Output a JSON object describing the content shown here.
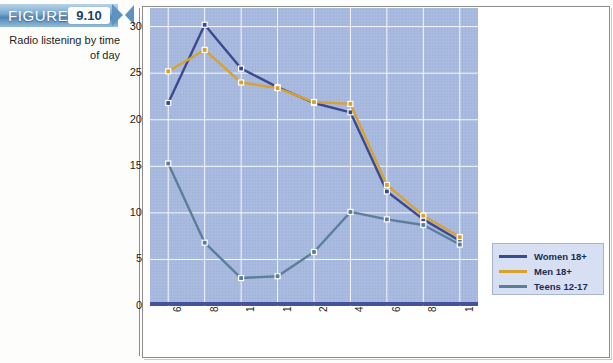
{
  "figure": {
    "word": "FIGURE",
    "number": "9.10",
    "caption": "Radio listening by time of day"
  },
  "legend": {
    "position": "bottom-right",
    "entries": [
      {
        "label": "Women 18+",
        "color": "#3b4a8c"
      },
      {
        "label": "Men 18+",
        "color": "#d9a22e"
      },
      {
        "label": "Teens 12-17",
        "color": "#5b7f9b"
      }
    ]
  },
  "chart_data": {
    "type": "line",
    "title": "Radio listening by time of day",
    "xlabel": "",
    "ylabel": "",
    "ylim": [
      0,
      32
    ],
    "yticks": [
      0,
      5,
      10,
      15,
      20,
      25,
      30
    ],
    "grid": true,
    "categories": [
      "6A-8A",
      "8A-10A",
      "10A-12P",
      "12P-2P",
      "2P-4P",
      "4P-6P",
      "6P-8P",
      "8P-10P",
      "10P-12P"
    ],
    "series": [
      {
        "name": "Women 18+",
        "color": "#3b4a8c",
        "values": [
          21.8,
          30.2,
          25.5,
          23.5,
          21.8,
          20.8,
          12.3,
          9.3,
          7.0
        ]
      },
      {
        "name": "Men 18+",
        "color": "#d9a22e",
        "values": [
          25.2,
          27.5,
          24.0,
          23.4,
          21.9,
          21.7,
          13.0,
          9.7,
          7.4
        ]
      },
      {
        "name": "Teens 12-17",
        "color": "#5b7f9b",
        "values": [
          15.3,
          6.8,
          3.0,
          3.2,
          5.8,
          10.1,
          9.3,
          8.7,
          6.6
        ]
      }
    ]
  }
}
